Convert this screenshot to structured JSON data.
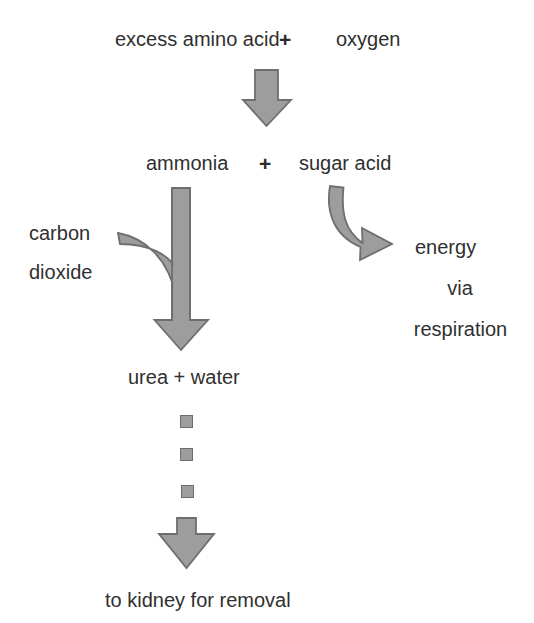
{
  "diagram": {
    "background_color": "#ffffff",
    "text_color": "#2f2f2f",
    "arrow_fill": "#9d9d9d",
    "arrow_stroke": "#6e6e6e"
  },
  "labels": {
    "reactant_1": "excess amino acid",
    "plus_1": "+",
    "reactant_2": "oxygen",
    "product_1": "ammonia",
    "plus_2": "+",
    "product_2": "sugar acid",
    "carbon": "carbon",
    "dioxide": "dioxide",
    "energy": "energy",
    "via": "via",
    "respiration": "respiration",
    "urea_water": "urea + water",
    "kidney": "to kidney for removal"
  },
  "icons": {
    "arrow_down_main": "down-block-arrow-icon",
    "arrow_curved_right": "curved-down-right-arrow-icon",
    "arrow_merge_down": "merging-down-arrow-icon",
    "arrow_down_final": "down-block-arrow-icon",
    "dash_square": "dashed-square-segment-icon"
  },
  "dashes": [
    {
      "x": 180,
      "y": 415
    },
    {
      "x": 180,
      "y": 448
    },
    {
      "x": 181,
      "y": 485
    }
  ]
}
